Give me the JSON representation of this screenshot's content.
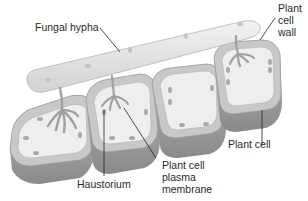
{
  "diagram": {
    "type": "biological-illustration",
    "labels": {
      "fungal_hypha": "Fungal hypha",
      "plant_cell_wall": [
        "Plant",
        "cell",
        "wall"
      ],
      "plant_cell": "Plant cell",
      "haustorium": "Haustorium",
      "plant_cell_plasma_membrane": [
        "Plant cell",
        "plasma",
        "membrane"
      ]
    },
    "colors": {
      "background": "#ffffff",
      "cell_wall": "#c8c8c8",
      "cell_interior": "#eeeeee",
      "cell_side_shade": "#9a9a9a",
      "hypha_fill": "#e6e6e6",
      "hypha_outline": "#b4b4b4",
      "organelle": "#a8a8a8",
      "leader_line": "#222222",
      "label_text": "#2a2a2a"
    },
    "cell_count": 4
  }
}
